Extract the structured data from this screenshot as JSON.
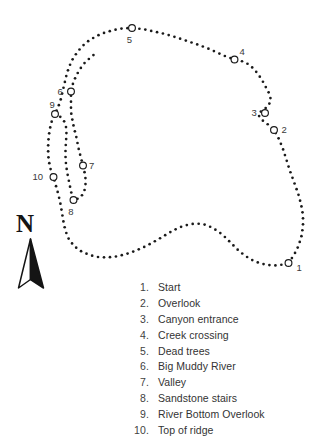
{
  "figure": {
    "kind": "trail-map",
    "background_color": "#ffffff",
    "ink_color": "#1a1a1a"
  },
  "compass": {
    "letter": "N",
    "direction": "north",
    "icon": "north-arrow-icon"
  },
  "map": {
    "markers": [
      {
        "number": "1",
        "cx": 288.5,
        "cy": 263.0,
        "label_dx": 8.0,
        "label_dy": 8.0
      },
      {
        "number": "2",
        "cx": 274.0,
        "cy": 130.0,
        "label_dx": 7.5,
        "label_dy": 3.2
      },
      {
        "number": "3",
        "cx": 265.0,
        "cy": 113.0,
        "label_dx": -13.5,
        "label_dy": 3.2
      },
      {
        "number": "4",
        "cx": 234.5,
        "cy": 59.5,
        "label_dx": 5.0,
        "label_dy": -4.5
      },
      {
        "number": "5",
        "cx": 132.0,
        "cy": 28.0,
        "label_dx": -2.6,
        "label_dy": 15.0
      },
      {
        "number": "6",
        "cx": 71.0,
        "cy": 91.5,
        "label_dx": -13.5,
        "label_dy": 3.2
      },
      {
        "number": "7",
        "cx": 83.0,
        "cy": 165.5,
        "label_dx": 6.0,
        "label_dy": 3.2
      },
      {
        "number": "8",
        "cx": 73.5,
        "cy": 200.0,
        "label_dx": -2.6,
        "label_dy": 14.5
      },
      {
        "number": "9",
        "cx": 55.0,
        "cy": 114.0,
        "label_dx": -2.8,
        "label_dy": -6.5
      },
      {
        "number": "10",
        "cx": 53.5,
        "cy": 177.0,
        "label_dx": -21.0,
        "label_dy": 3.2
      }
    ],
    "outer_loop": [
      [
        288.5,
        263.0
      ],
      [
        294.0,
        255.0
      ],
      [
        298.5,
        246.0
      ],
      [
        301.5,
        236.0
      ],
      [
        303.0,
        226.0
      ],
      [
        303.0,
        215.0
      ],
      [
        301.0,
        204.0
      ],
      [
        298.0,
        193.0
      ],
      [
        294.0,
        182.0
      ],
      [
        290.0,
        171.0
      ],
      [
        286.5,
        160.0
      ],
      [
        283.0,
        149.0
      ],
      [
        279.0,
        139.0
      ],
      [
        274.0,
        130.0
      ],
      [
        268.0,
        124.5
      ],
      [
        262.0,
        120.0
      ],
      [
        258.0,
        114.5
      ],
      [
        262.5,
        110.0
      ],
      [
        268.0,
        106.5
      ],
      [
        271.0,
        100.0
      ],
      [
        269.0,
        93.0
      ],
      [
        265.5,
        86.5
      ],
      [
        262.0,
        80.0
      ],
      [
        258.0,
        74.0
      ],
      [
        253.5,
        68.5
      ],
      [
        248.0,
        64.0
      ],
      [
        241.5,
        61.0
      ],
      [
        234.5,
        59.5
      ],
      [
        226.0,
        56.5
      ],
      [
        217.0,
        52.5
      ],
      [
        208.0,
        48.5
      ],
      [
        199.0,
        45.0
      ],
      [
        190.0,
        42.0
      ],
      [
        181.0,
        39.0
      ],
      [
        172.0,
        36.0
      ],
      [
        163.0,
        33.5
      ],
      [
        154.0,
        31.5
      ],
      [
        145.0,
        29.5
      ],
      [
        136.0,
        28.3
      ],
      [
        132.0,
        28.0
      ],
      [
        123.0,
        28.3
      ],
      [
        114.0,
        30.0
      ],
      [
        105.0,
        32.5
      ],
      [
        96.5,
        36.0
      ],
      [
        89.0,
        40.5
      ],
      [
        82.5,
        46.0
      ],
      [
        77.0,
        52.5
      ],
      [
        72.5,
        59.5
      ],
      [
        69.0,
        67.0
      ],
      [
        66.5,
        75.0
      ],
      [
        64.5,
        83.5
      ],
      [
        62.5,
        92.0
      ],
      [
        60.5,
        100.5
      ],
      [
        58.0,
        107.5
      ],
      [
        55.0,
        114.0
      ],
      [
        51.5,
        122.0
      ],
      [
        49.5,
        130.5
      ],
      [
        48.5,
        139.5
      ],
      [
        48.0,
        148.5
      ],
      [
        48.5,
        158.0
      ],
      [
        50.0,
        167.5
      ],
      [
        53.5,
        177.0
      ],
      [
        56.0,
        186.0
      ],
      [
        58.5,
        195.0
      ],
      [
        60.5,
        204.0
      ],
      [
        62.0,
        213.0
      ],
      [
        63.5,
        222.0
      ],
      [
        65.5,
        231.0
      ],
      [
        69.0,
        239.5
      ],
      [
        74.5,
        246.5
      ],
      [
        81.5,
        251.5
      ],
      [
        89.5,
        255.0
      ],
      [
        98.0,
        257.0
      ],
      [
        107.0,
        257.5
      ],
      [
        116.0,
        256.5
      ],
      [
        125.0,
        254.5
      ],
      [
        133.5,
        251.5
      ],
      [
        142.0,
        248.0
      ],
      [
        150.0,
        244.0
      ],
      [
        158.0,
        239.5
      ],
      [
        165.5,
        235.0
      ],
      [
        173.0,
        230.5
      ],
      [
        180.5,
        227.0
      ],
      [
        188.5,
        224.5
      ],
      [
        196.5,
        223.5
      ],
      [
        204.5,
        224.5
      ],
      [
        212.0,
        227.5
      ],
      [
        219.0,
        232.0
      ],
      [
        225.5,
        237.5
      ],
      [
        231.5,
        243.5
      ],
      [
        237.5,
        249.5
      ],
      [
        244.0,
        255.0
      ],
      [
        251.0,
        259.5
      ],
      [
        259.0,
        263.0
      ],
      [
        267.5,
        265.0
      ],
      [
        276.0,
        265.5
      ],
      [
        283.0,
        264.5
      ]
    ],
    "inner_spur": [
      [
        55.0,
        114.0
      ],
      [
        60.0,
        116.5
      ],
      [
        64.0,
        121.0
      ],
      [
        66.0,
        127.0
      ],
      [
        66.5,
        134.0
      ],
      [
        66.0,
        141.5
      ],
      [
        65.5,
        149.0
      ],
      [
        65.5,
        156.5
      ],
      [
        66.0,
        164.0
      ],
      [
        67.0,
        171.5
      ],
      [
        68.5,
        179.0
      ],
      [
        70.0,
        186.5
      ],
      [
        71.5,
        193.5
      ],
      [
        73.5,
        200.0
      ],
      [
        80.0,
        198.0
      ],
      [
        84.0,
        192.5
      ],
      [
        85.5,
        185.5
      ],
      [
        85.5,
        178.5
      ],
      [
        84.5,
        172.0
      ],
      [
        83.0,
        165.5
      ],
      [
        81.0,
        158.0
      ],
      [
        79.0,
        150.5
      ],
      [
        77.5,
        143.0
      ],
      [
        76.0,
        135.5
      ],
      [
        74.0,
        128.0
      ],
      [
        72.5,
        120.5
      ],
      [
        71.0,
        112.0
      ],
      [
        71.0,
        103.0
      ],
      [
        71.0,
        95.0
      ],
      [
        71.0,
        91.5
      ],
      [
        73.0,
        83.5
      ],
      [
        76.0,
        76.0
      ],
      [
        80.0,
        69.0
      ],
      [
        85.0,
        62.5
      ],
      [
        91.0,
        57.0
      ],
      [
        97.5,
        52.0
      ]
    ]
  },
  "legend": {
    "items": [
      {
        "number": "1.",
        "label": "Start"
      },
      {
        "number": "2.",
        "label": "Overlook"
      },
      {
        "number": "3.",
        "label": "Canyon entrance"
      },
      {
        "number": "4.",
        "label": "Creek crossing"
      },
      {
        "number": "5.",
        "label": "Dead trees"
      },
      {
        "number": "6.",
        "label": "Big Muddy River"
      },
      {
        "number": "7.",
        "label": "Valley"
      },
      {
        "number": "8.",
        "label": "Sandstone stairs"
      },
      {
        "number": "9.",
        "label": "River Bottom Overlook"
      },
      {
        "number": "10.",
        "label": "Top of ridge"
      }
    ]
  }
}
